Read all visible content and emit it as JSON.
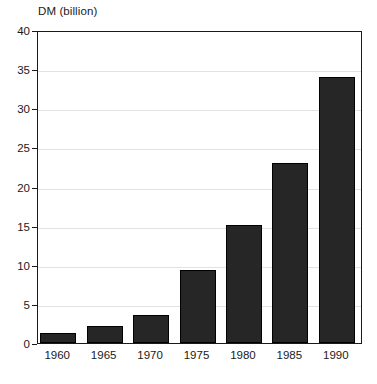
{
  "chart_data": {
    "type": "bar",
    "title": "",
    "axis_unit_label": "DM (billion)",
    "xlabel": "",
    "ylabel": "DM (billion)",
    "categories": [
      "1960",
      "1965",
      "1970",
      "1975",
      "1980",
      "1985",
      "1990"
    ],
    "values": [
      1.3,
      2.2,
      3.6,
      9.3,
      15.1,
      23.0,
      34.0
    ],
    "ylim": [
      0,
      40
    ],
    "ytick_labels": [
      "0",
      "5",
      "10",
      "15",
      "20",
      "25",
      "30",
      "35",
      "40"
    ],
    "ytick_values": [
      0,
      5,
      10,
      15,
      20,
      25,
      30,
      35,
      40
    ],
    "grid": true,
    "grid_axis": "y",
    "legend": false,
    "legend_position": "none",
    "bar_color": "#262626",
    "grid_color": "#e2e2e2",
    "axis_color": "#1a1a1a",
    "background_color": "#ffffff"
  }
}
